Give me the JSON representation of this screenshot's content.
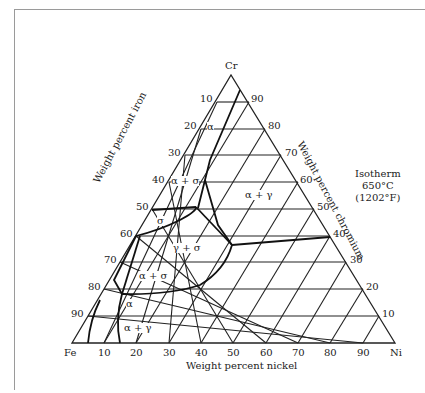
{
  "diagram": {
    "type": "ternary-phase-diagram",
    "vertices": {
      "top": "Cr",
      "left": "Fe",
      "right": "Ni"
    },
    "axis_titles": {
      "left": "Weight percent iron",
      "right": "Weight percent chromium",
      "bottom": "Weight percent nickel"
    },
    "annotation": {
      "line1": "Isotherm",
      "line2": "650°C",
      "line3": "(1202°F)"
    },
    "left_ticks": [
      "10",
      "20",
      "30",
      "40",
      "50",
      "60",
      "70",
      "80",
      "90"
    ],
    "right_ticks": [
      "90",
      "80",
      "70",
      "60",
      "50",
      "40",
      "30",
      "20",
      "10"
    ],
    "bottom_ticks": [
      "10",
      "20",
      "30",
      "40",
      "50",
      "60",
      "70",
      "80",
      "90"
    ],
    "phase_labels": [
      {
        "id": "alpha-top",
        "text": "α"
      },
      {
        "id": "alpha-sigma-upper",
        "text": "α + σ"
      },
      {
        "id": "alpha-gamma-right",
        "text": "α + γ"
      },
      {
        "id": "sigma",
        "text": "σ"
      },
      {
        "id": "gamma-sigma",
        "text": "γ + σ"
      },
      {
        "id": "alpha-sigma-lower",
        "text": "α + σ"
      },
      {
        "id": "alpha-bottom",
        "text": "α"
      },
      {
        "id": "alpha-gamma-bottom",
        "text": "α + γ"
      }
    ]
  }
}
